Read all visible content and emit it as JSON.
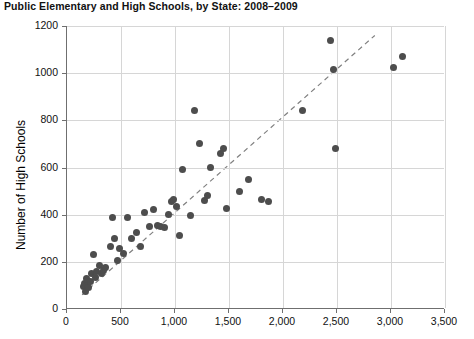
{
  "chart_data": {
    "type": "scatter",
    "title": "Public Elementary and High Schools, by State: 2008–2009",
    "xlabel": "",
    "ylabel": "Number of High Schools",
    "xlim": [
      0,
      3500
    ],
    "ylim": [
      0,
      1200
    ],
    "xticks": [
      "0",
      "500",
      "1,000",
      "1,500",
      "2,000",
      "2,500",
      "3,000",
      "3,500"
    ],
    "xtick_values": [
      0,
      500,
      1000,
      1500,
      2000,
      2500,
      3000,
      3500
    ],
    "yticks": [
      "0",
      "200",
      "400",
      "600",
      "800",
      "1000",
      "1200"
    ],
    "ytick_values": [
      0,
      200,
      400,
      600,
      800,
      1000,
      1200
    ],
    "grid": true,
    "legend": null,
    "marker_color": "#4d4d4d",
    "trendline": {
      "style": "dashed",
      "color": "#808080",
      "x0": 140,
      "y0": 60,
      "x1": 2850,
      "y1": 1160
    },
    "points": [
      [
        150,
        95
      ],
      [
        160,
        110
      ],
      [
        170,
        75
      ],
      [
        180,
        130
      ],
      [
        190,
        100
      ],
      [
        200,
        90
      ],
      [
        215,
        115
      ],
      [
        230,
        150
      ],
      [
        245,
        230
      ],
      [
        260,
        135
      ],
      [
        275,
        160
      ],
      [
        300,
        185
      ],
      [
        315,
        150
      ],
      [
        340,
        165
      ],
      [
        360,
        175
      ],
      [
        400,
        265
      ],
      [
        420,
        390
      ],
      [
        440,
        300
      ],
      [
        470,
        205
      ],
      [
        490,
        255
      ],
      [
        520,
        235
      ],
      [
        560,
        390
      ],
      [
        600,
        300
      ],
      [
        640,
        325
      ],
      [
        680,
        265
      ],
      [
        720,
        410
      ],
      [
        760,
        350
      ],
      [
        800,
        420
      ],
      [
        840,
        355
      ],
      [
        870,
        350
      ],
      [
        900,
        345
      ],
      [
        940,
        400
      ],
      [
        965,
        455
      ],
      [
        985,
        465
      ],
      [
        1010,
        435
      ],
      [
        1040,
        310
      ],
      [
        1070,
        590
      ],
      [
        1140,
        395
      ],
      [
        1180,
        840
      ],
      [
        1230,
        700
      ],
      [
        1270,
        460
      ],
      [
        1300,
        480
      ],
      [
        1330,
        600
      ],
      [
        1420,
        660
      ],
      [
        1450,
        680
      ],
      [
        1480,
        425
      ],
      [
        1600,
        500
      ],
      [
        1680,
        550
      ],
      [
        1800,
        465
      ],
      [
        1870,
        455
      ],
      [
        2180,
        840
      ],
      [
        2440,
        1140
      ],
      [
        2470,
        1015
      ],
      [
        2490,
        680
      ],
      [
        3020,
        1025
      ],
      [
        3110,
        1070
      ]
    ]
  }
}
